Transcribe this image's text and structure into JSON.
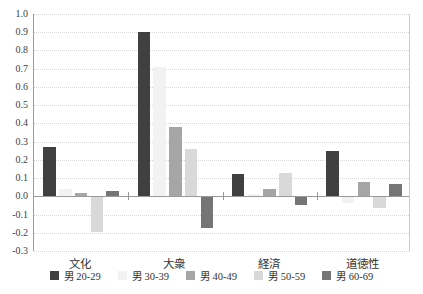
{
  "chart_data": {
    "type": "bar",
    "title": "",
    "categories": [
      "文化",
      "大衆",
      "経済",
      "道徳性"
    ],
    "series": [
      {
        "name": "男 20-29",
        "color": "#404040",
        "values": [
          0.27,
          0.9,
          0.12,
          0.25
        ]
      },
      {
        "name": "男 30-39",
        "color": "#f2f2f2",
        "values": [
          0.04,
          0.71,
          0.01,
          -0.03
        ]
      },
      {
        "name": "男 40-49",
        "color": "#a6a6a6",
        "values": [
          0.02,
          0.38,
          0.04,
          0.08
        ]
      },
      {
        "name": "男 50-59",
        "color": "#d9d9d9",
        "values": [
          -0.19,
          0.26,
          0.13,
          -0.06
        ]
      },
      {
        "name": "男 60-69",
        "color": "#757575",
        "values": [
          0.03,
          -0.17,
          -0.04,
          0.07
        ]
      }
    ],
    "ylim": [
      -0.3,
      1.0
    ],
    "ytick_step": 0.1,
    "ytick_labels": [
      "1.0",
      "0.9",
      "0.8",
      "0.7",
      "0.6",
      "0.5",
      "0.4",
      "0.3",
      "0.2",
      "0.1",
      "0.0",
      "-0.1",
      "-0.2",
      "-0.3"
    ],
    "grid": "dotted-horizontal",
    "legend_position": "bottom",
    "colors": {
      "grid": "#d6d6d6",
      "axis": "#999999",
      "plot_right_border": "#cccccc",
      "text": "#404040",
      "background": "#ffffff"
    }
  }
}
